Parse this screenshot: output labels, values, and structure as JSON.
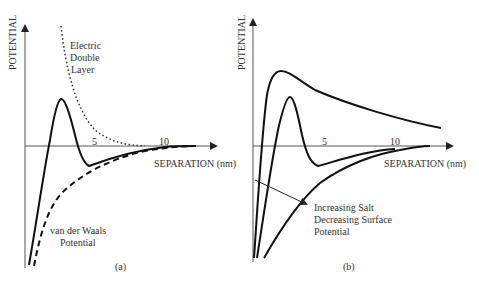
{
  "panels": [
    {
      "id": "a",
      "caption": "(a)",
      "y_axis_label": "POTENTIAL",
      "x_axis_label": "SEPARATION (nm)",
      "x_ticks": [
        "5",
        "10"
      ],
      "annotations": {
        "edl": [
          "Electric",
          "Double",
          "Layer"
        ],
        "vdw": [
          "van der Waals",
          "Potential"
        ]
      },
      "curves": [
        {
          "name": "total-potential",
          "style": "solid"
        },
        {
          "name": "van-der-waals-potential",
          "style": "dashed"
        },
        {
          "name": "electric-double-layer",
          "style": "dotted"
        }
      ]
    },
    {
      "id": "b",
      "caption": "(b)",
      "y_axis_label": "POTENTIAL",
      "x_axis_label": "SEPARATION (nm)",
      "x_ticks": [
        "5",
        "10"
      ],
      "annotations": {
        "trend": [
          "Increasing Salt",
          "Decreasing Surface",
          "Potential"
        ]
      },
      "curves": [
        {
          "name": "high-barrier-curve",
          "style": "solid"
        },
        {
          "name": "medium-barrier-curve",
          "style": "solid"
        },
        {
          "name": "no-barrier-curve",
          "style": "solid"
        }
      ]
    }
  ]
}
